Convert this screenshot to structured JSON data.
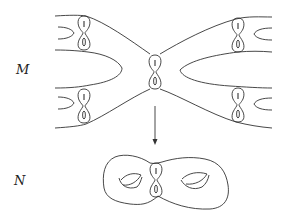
{
  "diagram": {
    "type": "covering-map illustration",
    "labels": {
      "top_space": "M",
      "bottom_space": "N"
    },
    "elements": {
      "top_surface": "infinite-genus surface with five figure-eight curves (cross-shaped tube)",
      "arrow": "downward projection arrow from M to N",
      "bottom_surface": "genus-two surface with a figure-eight curve at the waist"
    },
    "colors": {
      "stroke": "#333333",
      "background": "#ffffff",
      "text": "#222222"
    }
  }
}
